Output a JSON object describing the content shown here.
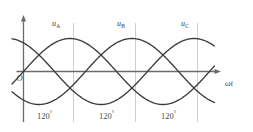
{
  "figure": {
    "origin_label": "O",
    "x_axis_label": "ωt",
    "colors": {
      "curve": "#3c3c3c",
      "axis": "#6b6b6b",
      "gridline": "#c9c9c9",
      "text": "#3a3a3a",
      "background": "#ffffff"
    }
  },
  "curve_labels": [
    {
      "name": "u_A",
      "base": "u",
      "sub": "A",
      "x": 52,
      "y": 20
    },
    {
      "name": "u_B",
      "base": "u",
      "sub": "B",
      "x": 117,
      "y": 20
    },
    {
      "name": "u_C",
      "base": "u",
      "sub": "C",
      "x": 181,
      "y": 20
    }
  ],
  "angle_labels": [
    {
      "text": "120",
      "unit": "°",
      "x": 37,
      "y": 112
    },
    {
      "text": "120",
      "unit": "°",
      "x": 99,
      "y": 112
    },
    {
      "text": "120",
      "unit": "°",
      "x": 161,
      "y": 112
    }
  ],
  "chart_data": {
    "type": "line",
    "xlabel": "ωt",
    "ylabel": "u",
    "xlim": [
      0,
      420
    ],
    "ylim": [
      -1.15,
      1.15
    ],
    "grid": true,
    "legend_position": "inline-above-peaks",
    "x_unit": "degrees",
    "x_gridlines": [
      120,
      240,
      360
    ],
    "x_tick_labels": [
      "120°",
      "120°",
      "120°"
    ],
    "series": [
      {
        "name": "u_A",
        "phase_deg": 0,
        "amplitude": 1,
        "function": "sin(wt)"
      },
      {
        "name": "u_B",
        "phase_deg": -120,
        "amplitude": 1,
        "function": "sin(wt - 120°)"
      },
      {
        "name": "u_C",
        "phase_deg": -240,
        "amplitude": 1,
        "function": "sin(wt - 240°)"
      }
    ]
  },
  "geometry": {
    "axis_y": 71.5,
    "axis_x": 23.5,
    "x_start": 23.5,
    "x_end": 218,
    "y_top": 17,
    "y_bottom": 122,
    "amplitude_px": 33,
    "period_px": 186,
    "gridline_xs": [
      73.5,
      135.5,
      197.5
    ],
    "curve_draw_start": 12,
    "curve_draw_end": 215
  }
}
